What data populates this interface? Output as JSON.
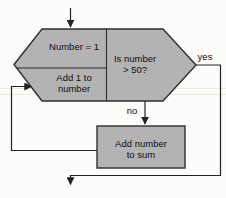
{
  "colors": {
    "background": "#fcfcfa",
    "node_fill": "#b3b3b3",
    "node_stroke": "#2f2f2f",
    "connector": "#222222",
    "label_text": "#0f0f0f"
  },
  "flowchart": {
    "type": "loop-flowchart",
    "loop_hexagon": {
      "init_label": "Number = 1",
      "increment_label_line1": "Add 1 to",
      "increment_label_line2": "number",
      "condition_label_line1": "Is number",
      "condition_label_line2": "> 50?"
    },
    "process_box": {
      "label_line1": "Add number",
      "label_line2": "to sum"
    },
    "branch_labels": {
      "yes": "yes",
      "no": "no"
    }
  }
}
